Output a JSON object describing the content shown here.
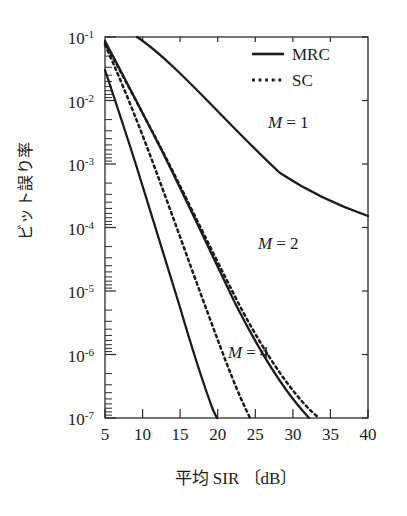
{
  "figure": {
    "background": "#ffffff",
    "ink_color": "#1b1b1b"
  },
  "axis": {
    "x_title": "平均 SIR 〔dB〕",
    "y_title": "ビット誤り率",
    "x_ticklabels": [
      "5",
      "10",
      "15",
      "20",
      "25",
      "30",
      "35",
      "40"
    ],
    "y_ticklabels": [
      "10⁻¹",
      "10⁻²",
      "10⁻³",
      "10⁻⁴",
      "10⁻⁵",
      "10⁻⁶",
      "10⁻⁷"
    ],
    "y_mantissa": "10",
    "y_exponents": [
      "-1",
      "-2",
      "-3",
      "-4",
      "-5",
      "-6",
      "-7"
    ]
  },
  "legend": {
    "position": "top-right",
    "entries": [
      {
        "label": "MRC",
        "style": "solid"
      },
      {
        "label": "SC",
        "style": "dotted"
      }
    ]
  },
  "annotations": [
    {
      "name": "m-equals-1",
      "var": "M",
      "rest": "= 1",
      "x": 268,
      "y": 128
    },
    {
      "name": "m-equals-2",
      "var": "M",
      "rest": "= 2",
      "x": 258,
      "y": 249
    },
    {
      "name": "m-equals-4",
      "var": "M",
      "rest": "= 4",
      "x": 228,
      "y": 358
    }
  ],
  "chart_data": {
    "type": "line",
    "title": "",
    "xlabel": "平均 SIR 〔dB〕",
    "ylabel": "ビット誤り率",
    "xlim": [
      5,
      40
    ],
    "ylim": [
      1e-07,
      0.1
    ],
    "yscale": "log",
    "xscale": "linear",
    "grid": false,
    "xticks": [
      5,
      10,
      15,
      20,
      25,
      30,
      35,
      40
    ],
    "yticks": [
      0.1,
      0.01,
      0.001,
      0.0001,
      1e-05,
      1e-06,
      1e-07
    ],
    "legend_position": "top-right",
    "series": [
      {
        "name": "MRC, M = 1",
        "style": "solid",
        "diversity_order": 1,
        "x": [
          5,
          7,
          9,
          11,
          13,
          15,
          17,
          19,
          21,
          23,
          25,
          27,
          29,
          31,
          33,
          35,
          37,
          40
        ],
        "y": [
          0.1,
          0.07,
          0.047,
          0.032,
          0.021,
          0.014,
          0.0092,
          0.006,
          0.0039,
          0.0025,
          0.0016,
          0.001,
          0.00065,
          0.00041,
          0.00026,
          0.00017,
          0.00011,
          7.8e-05
        ]
      },
      {
        "name": "SC, M = 1",
        "style": "dotted",
        "diversity_order": 1,
        "x": [
          5,
          7,
          9,
          11,
          13,
          15,
          17,
          19,
          21,
          23,
          25,
          27,
          29,
          31,
          33,
          35,
          37,
          40
        ],
        "y": [
          0.1,
          0.07,
          0.047,
          0.032,
          0.021,
          0.014,
          0.0092,
          0.006,
          0.0039,
          0.0025,
          0.0016,
          0.001,
          0.00065,
          0.00041,
          0.00026,
          0.00017,
          0.00011,
          7.8e-05
        ]
      },
      {
        "name": "MRC, M = 2",
        "style": "solid",
        "diversity_order": 2,
        "x": [
          5,
          8,
          11,
          14,
          17,
          20,
          23,
          26,
          29,
          32,
          35,
          37
        ],
        "y": [
          0.085,
          0.036,
          0.014,
          0.005,
          0.0017,
          0.00055,
          0.00017,
          5.2e-05,
          1.5e-05,
          4.3e-06,
          1.2e-06,
          5.5e-07
        ]
      },
      {
        "name": "SC, M = 2",
        "style": "dotted",
        "diversity_order": 2,
        "x": [
          5,
          8,
          11,
          14,
          17,
          20,
          23,
          26,
          29,
          32,
          35,
          38.5
        ],
        "y": [
          0.09,
          0.04,
          0.016,
          0.006,
          0.0021,
          0.0007,
          0.00022,
          6.8e-05,
          2e-05,
          5.8e-06,
          1.6e-06,
          3.6e-07
        ]
      },
      {
        "name": "MRC, M = 4",
        "style": "solid",
        "diversity_order": 4,
        "x": [
          5,
          7,
          9,
          11,
          13,
          15,
          17,
          19,
          21,
          22.2
        ],
        "y": [
          0.03,
          0.009,
          0.0025,
          0.00065,
          0.00016,
          3.8e-05,
          8.5e-06,
          1.9e-06,
          4e-07,
          1.4e-07
        ]
      },
      {
        "name": "SC, M = 4",
        "style": "dotted",
        "diversity_order": 4,
        "x": [
          5,
          7,
          9,
          11,
          13,
          15,
          17,
          19,
          21,
          23,
          25
        ],
        "y": [
          0.075,
          0.027,
          0.009,
          0.0028,
          0.00082,
          0.00023,
          6.2e-05,
          1.6e-05,
          4e-06,
          9.5e-07,
          2.2e-07
        ]
      }
    ]
  },
  "geometry": {
    "plot_left": 105,
    "plot_right": 368,
    "plot_top": 37,
    "plot_bottom": 418
  }
}
